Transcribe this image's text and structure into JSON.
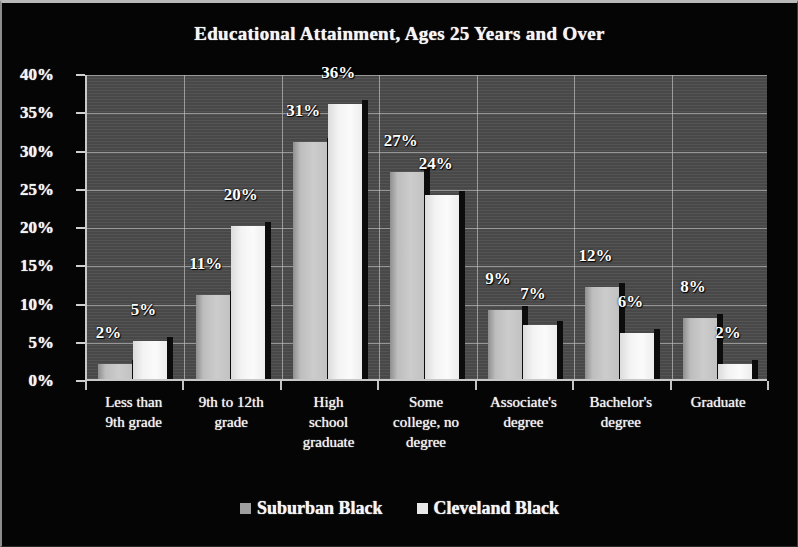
{
  "chart_data": {
    "type": "bar",
    "title": "Educational Attainment, Ages 25 Years and Over",
    "xlabel": "",
    "ylabel": "",
    "ylim": [
      0,
      40
    ],
    "ytick_labels": [
      "0%",
      "5%",
      "10%",
      "15%",
      "20%",
      "25%",
      "30%",
      "35%",
      "40%"
    ],
    "ytick_values": [
      0,
      5,
      10,
      15,
      20,
      25,
      30,
      35,
      40
    ],
    "grid": true,
    "legend_position": "bottom",
    "categories": [
      "Less than\n9th grade",
      "9th to 12th\ngrade",
      "High\nschool\ngraduate",
      "Some\ncollege, no\ndegree",
      "Associate's\ndegree",
      "Bachelor's\ndegree",
      "Graduate"
    ],
    "series": [
      {
        "name": "Suburban Black",
        "color": "#c0c0c0",
        "values": [
          2,
          11,
          31,
          27,
          9,
          12,
          8
        ],
        "labels": [
          "2%",
          "11%",
          "31%",
          "27%",
          "9%",
          "12%",
          "8%"
        ]
      },
      {
        "name": "Cleveland Black",
        "color": "#f2f2f2",
        "values": [
          5,
          20,
          36,
          24,
          7,
          6,
          2
        ],
        "labels": [
          "5%",
          "20%",
          "36%",
          "24%",
          "7%",
          "6%",
          "2%"
        ]
      }
    ]
  }
}
